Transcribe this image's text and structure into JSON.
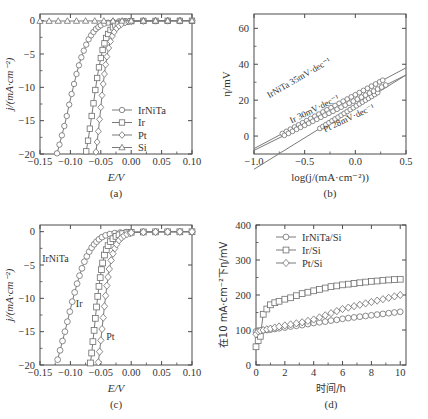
{
  "figure": {
    "panels": [
      "a",
      "b",
      "c",
      "d"
    ],
    "line_color": "#7a7a7a",
    "marker_color": "#6e6e6e",
    "axis_color": "#4a4a4a"
  },
  "panel_a": {
    "caption": "(a)",
    "legend": [
      {
        "label": "IrNiTa",
        "marker": "circle"
      },
      {
        "label": "Ir",
        "marker": "square"
      },
      {
        "label": "Pt",
        "marker": "diamond"
      },
      {
        "label": "Si",
        "marker": "triangle"
      }
    ],
    "chart_data": {
      "type": "line",
      "title": "",
      "xlabel": "E/V",
      "ylabel": "j/(mA·cm⁻²)",
      "xlim": [
        -0.15,
        0.1
      ],
      "ylim": [
        -20,
        1
      ],
      "xticks": [
        -0.15,
        -0.1,
        -0.05,
        0.0,
        0.05,
        0.1
      ],
      "xticklabels": [
        "−0.15",
        "−0.10",
        "−0.05",
        "0.00",
        "0.05",
        "0.10"
      ],
      "yticks": [
        0,
        -5,
        -10,
        -15,
        -20
      ],
      "yticklabels": [
        "0",
        "−5",
        "−10",
        "−15",
        "−20"
      ],
      "grid": false,
      "legend_position": "lower right",
      "series": [
        {
          "name": "IrNiTa",
          "marker": "circle",
          "x": [
            -0.122,
            -0.118,
            -0.114,
            -0.11,
            -0.106,
            -0.102,
            -0.098,
            -0.094,
            -0.09,
            -0.086,
            -0.082,
            -0.078,
            -0.074,
            -0.07,
            -0.066,
            -0.062,
            -0.058,
            -0.054,
            -0.05,
            -0.044,
            -0.038,
            -0.03,
            -0.02,
            -0.01,
            0.0,
            0.02,
            0.04,
            0.06,
            0.08,
            0.1
          ],
          "y": [
            -19.9,
            -18.6,
            -17.2,
            -15.8,
            -14.3,
            -12.6,
            -11.0,
            -9.5,
            -8.0,
            -6.7,
            -5.5,
            -4.5,
            -3.6,
            -2.8,
            -2.2,
            -1.7,
            -1.25,
            -0.95,
            -0.7,
            -0.45,
            -0.3,
            -0.18,
            -0.1,
            -0.06,
            -0.04,
            -0.03,
            -0.02,
            -0.02,
            -0.01,
            -0.01
          ]
        },
        {
          "name": "Ir",
          "marker": "square",
          "x": [
            -0.074,
            -0.071,
            -0.068,
            -0.065,
            -0.062,
            -0.059,
            -0.056,
            -0.053,
            -0.05,
            -0.047,
            -0.044,
            -0.041,
            -0.038,
            -0.034,
            -0.03,
            -0.026,
            -0.022,
            -0.016,
            -0.01,
            0.0,
            0.02,
            0.04,
            0.06,
            0.08,
            0.1
          ],
          "y": [
            -19.6,
            -18.0,
            -16.2,
            -14.3,
            -12.4,
            -10.4,
            -8.6,
            -7.0,
            -5.6,
            -4.4,
            -3.4,
            -2.6,
            -2.0,
            -1.4,
            -1.0,
            -0.7,
            -0.48,
            -0.28,
            -0.16,
            -0.07,
            -0.04,
            -0.03,
            -0.02,
            -0.02,
            -0.01
          ]
        },
        {
          "name": "Pt",
          "marker": "diamond",
          "x": [
            -0.058,
            -0.056,
            -0.054,
            -0.052,
            -0.05,
            -0.048,
            -0.046,
            -0.044,
            -0.042,
            -0.04,
            -0.037,
            -0.034,
            -0.031,
            -0.028,
            -0.024,
            -0.02,
            -0.016,
            -0.01,
            -0.004,
            0.0,
            0.02,
            0.04,
            0.06,
            0.08,
            0.1
          ],
          "y": [
            -19.7,
            -18.2,
            -16.6,
            -14.8,
            -13.0,
            -11.2,
            -9.5,
            -8.0,
            -6.6,
            -5.4,
            -4.1,
            -3.1,
            -2.3,
            -1.7,
            -1.15,
            -0.78,
            -0.52,
            -0.28,
            -0.15,
            -0.1,
            -0.05,
            -0.03,
            -0.02,
            -0.02,
            -0.01
          ]
        },
        {
          "name": "Si",
          "marker": "triangle",
          "x": [
            -0.15,
            -0.135,
            -0.12,
            -0.105,
            -0.09,
            -0.075,
            -0.06,
            -0.045,
            -0.03,
            -0.015,
            0.0,
            0.02,
            0.04,
            0.06,
            0.08,
            0.1
          ],
          "y": [
            -0.06,
            -0.06,
            -0.05,
            -0.05,
            -0.05,
            -0.04,
            -0.04,
            -0.04,
            -0.03,
            -0.03,
            -0.02,
            -0.02,
            -0.02,
            -0.01,
            -0.01,
            -0.01
          ]
        }
      ]
    }
  },
  "panel_b": {
    "caption": "(b)",
    "annotations": [
      {
        "text": "IrNiTa 35mV·dec⁻¹",
        "series": "IrNiTa"
      },
      {
        "text": "Ir 30mV·dec⁻¹",
        "series": "Ir"
      },
      {
        "text": "Pt 28mV·dec⁻¹",
        "series": "Pt"
      }
    ],
    "chart_data": {
      "type": "scatter",
      "title": "",
      "xlabel": "log(j/(mA·cm⁻²))",
      "ylabel": "η/mV",
      "xlim": [
        -1.0,
        0.5
      ],
      "ylim": [
        -10,
        68
      ],
      "xticks": [
        -1.0,
        -0.5,
        0.0,
        0.5
      ],
      "xticklabels": [
        "−1.0",
        "−0.5",
        "0.0",
        "0.5"
      ],
      "yticks": [
        0,
        20,
        40,
        60
      ],
      "yticklabels": [
        "0",
        "20",
        "40",
        "60"
      ],
      "grid": false,
      "series": [
        {
          "name": "IrNiTa",
          "marker": "circle",
          "tafel_slope_mV_dec": 35,
          "intercept_mV": 16.5,
          "x_data": [
            -0.35,
            -0.32,
            -0.29,
            -0.26,
            -0.23,
            -0.2,
            -0.17,
            -0.14,
            -0.11,
            -0.08,
            -0.05,
            -0.02,
            0.01,
            0.04,
            0.07,
            0.1,
            0.13,
            0.16,
            0.19,
            0.22
          ],
          "fit_x": [
            -1.0,
            0.5
          ]
        },
        {
          "name": "Ir",
          "marker": "circle",
          "tafel_slope_mV_dec": 30,
          "intercept_mV": 23.0,
          "x_data": [
            -0.72,
            -0.68,
            -0.64,
            -0.6,
            -0.56,
            -0.52,
            -0.48,
            -0.44,
            -0.4,
            -0.36,
            -0.32,
            -0.28,
            -0.24,
            -0.2,
            -0.16,
            -0.12,
            -0.08,
            -0.04,
            0.0,
            0.04,
            0.08,
            0.12,
            0.16,
            0.2,
            0.24,
            0.27
          ],
          "fit_x": [
            -1.0,
            0.5
          ]
        },
        {
          "name": "Pt",
          "marker": "circle",
          "tafel_slope_mV_dec": 28,
          "intercept_mV": 20.0,
          "x_data": [
            -0.7,
            -0.66,
            -0.62,
            -0.58,
            -0.54,
            -0.5,
            -0.46,
            -0.42,
            -0.38,
            -0.34,
            -0.3,
            -0.26,
            -0.22,
            -0.18,
            -0.14,
            -0.1,
            -0.06,
            -0.02,
            0.02,
            0.06,
            0.1,
            0.14,
            0.18,
            0.22,
            0.26,
            0.3
          ],
          "fit_x": [
            -1.0,
            0.5
          ]
        }
      ]
    }
  },
  "panel_c": {
    "caption": "(c)",
    "inline_labels": [
      {
        "text": "IrNiTa"
      },
      {
        "text": "Ir"
      },
      {
        "text": "Pt"
      }
    ],
    "chart_data": {
      "type": "line",
      "title": "",
      "xlabel": "E/V",
      "ylabel": "j/(mA·cm⁻²)",
      "xlim": [
        -0.15,
        0.1
      ],
      "ylim": [
        -20,
        1
      ],
      "xticks": [
        -0.15,
        -0.1,
        -0.05,
        0.0,
        0.05,
        0.1
      ],
      "xticklabels": [
        "−0.15",
        "−0.10",
        "−0.05",
        "0.00",
        "0.05",
        "0.10"
      ],
      "yticks": [
        0,
        -5,
        -10,
        -15,
        -20
      ],
      "yticklabels": [
        "0",
        "−5",
        "−10",
        "−15",
        "−20"
      ],
      "grid": false,
      "series": [
        {
          "name": "IrNiTa",
          "marker": "circle",
          "x": [
            -0.121,
            -0.117,
            -0.113,
            -0.109,
            -0.105,
            -0.101,
            -0.097,
            -0.093,
            -0.089,
            -0.085,
            -0.081,
            -0.077,
            -0.073,
            -0.069,
            -0.065,
            -0.061,
            -0.057,
            -0.053,
            -0.048,
            -0.042,
            -0.035,
            -0.027,
            -0.018,
            -0.008,
            0.0,
            0.02,
            0.04,
            0.06,
            0.08,
            0.1
          ],
          "y": [
            -19.2,
            -17.8,
            -16.4,
            -15.0,
            -13.5,
            -12.0,
            -10.5,
            -9.1,
            -7.8,
            -6.6,
            -5.5,
            -4.5,
            -3.7,
            -3.0,
            -2.4,
            -1.9,
            -1.5,
            -1.15,
            -0.82,
            -0.55,
            -0.36,
            -0.22,
            -0.13,
            -0.07,
            -0.05,
            -0.03,
            -0.02,
            -0.02,
            -0.01,
            -0.01
          ]
        },
        {
          "name": "Ir",
          "marker": "square",
          "x": [
            -0.067,
            -0.065,
            -0.063,
            -0.061,
            -0.059,
            -0.057,
            -0.055,
            -0.053,
            -0.051,
            -0.049,
            -0.047,
            -0.044,
            -0.041,
            -0.038,
            -0.034,
            -0.03,
            -0.025,
            -0.02,
            -0.014,
            -0.007,
            0.0,
            0.02,
            0.04,
            0.06,
            0.08,
            0.1
          ],
          "y": [
            -19.7,
            -18.2,
            -16.5,
            -14.8,
            -13.0,
            -11.3,
            -9.7,
            -8.2,
            -6.9,
            -5.7,
            -4.7,
            -3.5,
            -2.7,
            -2.1,
            -1.5,
            -1.05,
            -0.7,
            -0.48,
            -0.3,
            -0.17,
            -0.1,
            -0.05,
            -0.03,
            -0.02,
            -0.02,
            -0.01
          ]
        },
        {
          "name": "Pt",
          "marker": "diamond",
          "x": [
            -0.054,
            -0.052,
            -0.05,
            -0.048,
            -0.046,
            -0.044,
            -0.042,
            -0.04,
            -0.038,
            -0.036,
            -0.033,
            -0.03,
            -0.027,
            -0.024,
            -0.02,
            -0.016,
            -0.012,
            -0.007,
            -0.002,
            0.0,
            0.02,
            0.04,
            0.06,
            0.08,
            0.1
          ],
          "y": [
            -19.6,
            -18.0,
            -16.3,
            -14.6,
            -12.9,
            -11.2,
            -9.6,
            -8.1,
            -6.8,
            -5.6,
            -4.3,
            -3.3,
            -2.5,
            -1.9,
            -1.3,
            -0.9,
            -0.62,
            -0.38,
            -0.22,
            -0.16,
            -0.08,
            -0.04,
            -0.03,
            -0.02,
            -0.01
          ]
        }
      ]
    }
  },
  "panel_d": {
    "caption": "(d)",
    "legend": [
      {
        "label": "IrNiTa/Si",
        "marker": "circle"
      },
      {
        "label": "Ir/Si",
        "marker": "square"
      },
      {
        "label": "Pt/Si",
        "marker": "diamond"
      }
    ],
    "chart_data": {
      "type": "line",
      "title": "",
      "xlabel": "时间/h",
      "ylabel": "在10 mA·cm⁻²下η/mV",
      "xlim": [
        0,
        10.4
      ],
      "ylim": [
        0,
        400
      ],
      "xticks": [
        0,
        2,
        4,
        6,
        8,
        10
      ],
      "xticklabels": [
        "0",
        "2",
        "4",
        "6",
        "8",
        "10"
      ],
      "yticks": [
        0,
        100,
        200,
        300,
        400
      ],
      "yticklabels": [
        "0",
        "100",
        "200",
        "300",
        "400"
      ],
      "grid": false,
      "legend_position": "upper left",
      "series": [
        {
          "name": "IrNiTa/Si",
          "marker": "circle",
          "x": [
            0.0,
            0.15,
            0.3,
            0.5,
            0.75,
            1.0,
            1.3,
            1.6,
            2.0,
            2.4,
            2.8,
            3.2,
            3.6,
            4.0,
            4.4,
            4.8,
            5.2,
            5.6,
            6.0,
            6.4,
            6.8,
            7.2,
            7.6,
            8.0,
            8.4,
            8.8,
            9.2,
            9.6,
            10.0
          ],
          "y": [
            96,
            98,
            97,
            99,
            100,
            101,
            103,
            105,
            107,
            110,
            112,
            114,
            117,
            120,
            122,
            124,
            127,
            129,
            132,
            134,
            136,
            138,
            140,
            142,
            144,
            146,
            148,
            150,
            152
          ]
        },
        {
          "name": "Ir/Si",
          "marker": "square",
          "x": [
            0.0,
            0.15,
            0.3,
            0.5,
            0.75,
            1.0,
            1.3,
            1.6,
            2.0,
            2.4,
            2.8,
            3.2,
            3.6,
            4.0,
            4.4,
            4.8,
            5.2,
            5.6,
            6.0,
            6.4,
            6.8,
            7.2,
            7.6,
            8.0,
            8.4,
            8.8,
            9.2,
            9.6,
            10.0
          ],
          "y": [
            52,
            70,
            82,
            145,
            160,
            172,
            178,
            182,
            188,
            192,
            198,
            204,
            208,
            212,
            216,
            220,
            224,
            226,
            229,
            231,
            233,
            235,
            237,
            239,
            240,
            242,
            243,
            244,
            245
          ]
        },
        {
          "name": "Pt/Si",
          "marker": "diamond",
          "x": [
            0.0,
            0.15,
            0.3,
            0.5,
            0.75,
            1.0,
            1.3,
            1.6,
            2.0,
            2.4,
            2.8,
            3.2,
            3.6,
            4.0,
            4.4,
            4.8,
            5.2,
            5.6,
            6.0,
            6.4,
            6.8,
            7.2,
            7.6,
            8.0,
            8.4,
            8.8,
            9.2,
            9.6,
            10.0
          ],
          "y": [
            88,
            96,
            98,
            100,
            102,
            104,
            107,
            110,
            113,
            116,
            119,
            122,
            126,
            130,
            136,
            142,
            148,
            154,
            160,
            164,
            168,
            172,
            176,
            180,
            184,
            188,
            192,
            196,
            200
          ]
        }
      ]
    }
  }
}
